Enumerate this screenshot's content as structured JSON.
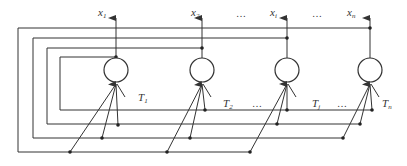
{
  "diagram": {
    "colors": {
      "line": "#333333",
      "node_fill": "#ffffff",
      "background": "#ffffff"
    },
    "outputs": [
      {
        "name": "x",
        "sub": "1"
      },
      {
        "name": "x",
        "sub": "2"
      },
      {
        "name": "x",
        "sub": "i"
      },
      {
        "name": "x",
        "sub": "n"
      }
    ],
    "thresholds": [
      {
        "name": "T",
        "sub": "1"
      },
      {
        "name": "T",
        "sub": "2"
      },
      {
        "name": "T",
        "sub": "j"
      },
      {
        "name": "T",
        "sub": "n"
      }
    ],
    "ellipsis": "…"
  }
}
